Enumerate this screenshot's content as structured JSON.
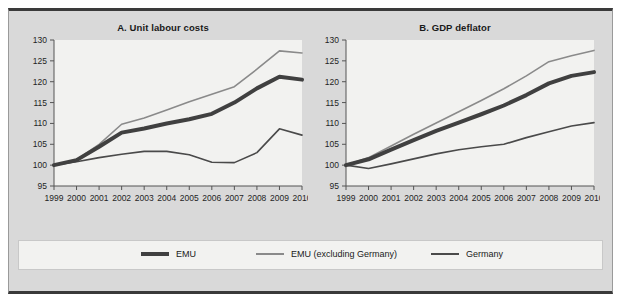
{
  "figure": {
    "background_color": "#d9d9d9",
    "plot_background_color": "#f2f2f0",
    "frame_color": "#3a3a3a"
  },
  "panels": [
    {
      "id": "A",
      "title": "A. Unit labour costs"
    },
    {
      "id": "B",
      "title": "B. GDP deflator"
    }
  ],
  "legend": {
    "items": [
      {
        "label": "EMU",
        "color": "#404040",
        "width": 4
      },
      {
        "label": "EMU (excluding Germany)",
        "color": "#8a8a8a",
        "width": 2
      },
      {
        "label": "Germany",
        "color": "#4a4a4a",
        "width": 2
      }
    ]
  },
  "chart_data": [
    {
      "type": "line",
      "title": "A. Unit labour costs",
      "xlabel": "",
      "ylabel": "",
      "x": [
        1999,
        2000,
        2001,
        2002,
        2003,
        2004,
        2005,
        2006,
        2007,
        2008,
        2009,
        2010
      ],
      "xticklabels": [
        "1999",
        "2000",
        "2001",
        "2002",
        "2003",
        "2004",
        "2005",
        "2006",
        "2007",
        "2008",
        "2009",
        "2010"
      ],
      "ylim": [
        95,
        130
      ],
      "yticks": [
        95,
        100,
        105,
        110,
        115,
        120,
        125,
        130
      ],
      "yticklabels": [
        "95",
        "100",
        "105",
        "110",
        "115",
        "120",
        "125",
        "130"
      ],
      "grid": false,
      "legend_position": "below-figure",
      "series": [
        {
          "name": "EMU",
          "color": "#404040",
          "width": 4,
          "values": [
            100.0,
            101.2,
            104.4,
            107.8,
            108.8,
            110.0,
            111.0,
            112.3,
            115.0,
            118.4,
            121.2,
            120.5
          ]
        },
        {
          "name": "EMU (excluding Germany)",
          "color": "#8a8a8a",
          "width": 1.6,
          "values": [
            100.0,
            101.3,
            105.0,
            109.8,
            111.3,
            113.2,
            115.2,
            117.0,
            118.8,
            123.0,
            127.4,
            126.9
          ]
        },
        {
          "name": "Germany",
          "color": "#4a4a4a",
          "width": 1.6,
          "values": [
            100.0,
            100.8,
            101.8,
            102.6,
            103.3,
            103.3,
            102.5,
            100.7,
            100.6,
            103.0,
            108.7,
            107.2
          ]
        }
      ]
    },
    {
      "type": "line",
      "title": "B. GDP deflator",
      "xlabel": "",
      "ylabel": "",
      "x": [
        1999,
        2000,
        2001,
        2002,
        2003,
        2004,
        2005,
        2006,
        2007,
        2008,
        2009,
        2010
      ],
      "xticklabels": [
        "1999",
        "2000",
        "2001",
        "2002",
        "2003",
        "2004",
        "2005",
        "2006",
        "2007",
        "2008",
        "2009",
        "2010"
      ],
      "ylim": [
        95,
        130
      ],
      "yticks": [
        95,
        100,
        105,
        110,
        115,
        120,
        125,
        130
      ],
      "yticklabels": [
        "95",
        "100",
        "105",
        "110",
        "115",
        "120",
        "125",
        "130"
      ],
      "grid": false,
      "legend_position": "below-figure",
      "series": [
        {
          "name": "EMU",
          "color": "#404040",
          "width": 4,
          "values": [
            100.0,
            101.4,
            103.7,
            106.0,
            108.2,
            110.2,
            112.2,
            114.3,
            116.8,
            119.6,
            121.4,
            122.3
          ]
        },
        {
          "name": "EMU (excluding Germany)",
          "color": "#8a8a8a",
          "width": 1.6,
          "values": [
            100.0,
            101.8,
            104.6,
            107.4,
            110.1,
            112.8,
            115.5,
            118.3,
            121.4,
            124.8,
            126.2,
            127.5
          ]
        },
        {
          "name": "Germany",
          "color": "#4a4a4a",
          "width": 1.6,
          "values": [
            100.0,
            99.2,
            100.3,
            101.5,
            102.7,
            103.7,
            104.4,
            105.0,
            106.6,
            108.0,
            109.4,
            110.2
          ]
        }
      ]
    }
  ]
}
